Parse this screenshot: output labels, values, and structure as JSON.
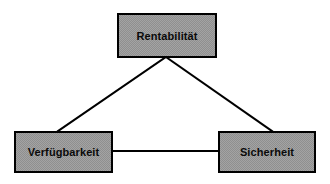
{
  "diagram": {
    "background_color": "#ffffff",
    "node_fill_color": "#a3a3a3",
    "node_border_color": "#000000",
    "connector_color": "#000000",
    "text_color": "#0a0a0a",
    "nodes": [
      {
        "id": "rentabilitaet",
        "label": "Rentabilität",
        "position": "top-center"
      },
      {
        "id": "verfuegbarkeit",
        "label": "Verfügbarkeit",
        "position": "bottom-left"
      },
      {
        "id": "sicherheit",
        "label": "Sicherheit",
        "position": "bottom-right"
      }
    ],
    "connectors": [
      {
        "id": "rentabilitaet-verfuegbarkeit",
        "from": "rentabilitaet",
        "to": "verfuegbarkeit",
        "style": "straight-line"
      },
      {
        "id": "rentabilitaet-sicherheit",
        "from": "rentabilitaet",
        "to": "sicherheit",
        "style": "straight-line"
      },
      {
        "id": "verfuegbarkeit-sicherheit",
        "from": "verfuegbarkeit",
        "to": "sicherheit",
        "style": "straight-line"
      }
    ]
  }
}
